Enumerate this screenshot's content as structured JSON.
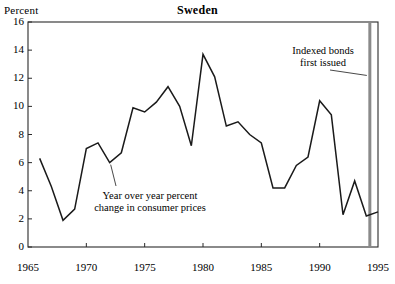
{
  "chart_data": {
    "type": "line",
    "title": "Sweden",
    "ylabel": "Percent",
    "xlabel": "",
    "ylim": [
      0,
      16
    ],
    "xlim": [
      1965,
      1995
    ],
    "yticks": [
      0,
      2,
      4,
      6,
      8,
      10,
      12,
      14,
      16
    ],
    "xticks": [
      1965,
      1970,
      1975,
      1980,
      1985,
      1990,
      1995
    ],
    "grid": false,
    "legend": "none",
    "series_name": "Year over year percent change in consumer prices",
    "x": [
      1966,
      1967,
      1968,
      1969,
      1970,
      1971,
      1972,
      1973,
      1974,
      1975,
      1976,
      1977,
      1978,
      1979,
      1980,
      1981,
      1982,
      1983,
      1984,
      1985,
      1986,
      1987,
      1988,
      1989,
      1990,
      1991,
      1992,
      1993,
      1994,
      1995
    ],
    "values": [
      6.3,
      4.3,
      1.9,
      2.7,
      7.0,
      7.4,
      6.0,
      6.7,
      9.9,
      9.6,
      10.3,
      11.4,
      10.0,
      7.2,
      13.7,
      12.1,
      8.6,
      8.9,
      8.0,
      7.4,
      4.2,
      4.2,
      5.8,
      6.4,
      10.4,
      9.4,
      2.3,
      4.7,
      2.2,
      2.5
    ],
    "annotations": [
      {
        "name": "series-label",
        "text_lines": [
          "Year over year percent",
          "change in consumer prices"
        ],
        "points_to_x": 1972,
        "points_to_y": 6.0
      },
      {
        "name": "indexed-bonds-label",
        "text_lines": [
          "Indexed bonds",
          "first issued"
        ],
        "points_to_x": 1994.3,
        "points_to_y": 12.2
      }
    ],
    "vertical_marker": {
      "name": "indexed-bonds-marker",
      "x": 1994.3,
      "color": "#8a8a8a"
    },
    "line_color": "#1a1a1a",
    "frame_color": "#2a2a2a"
  },
  "labels": {
    "unit": "Percent",
    "title": "Sweden",
    "yticks": [
      "0",
      "2",
      "4",
      "6",
      "8",
      "10",
      "12",
      "14",
      "16"
    ],
    "xticks": [
      "1965",
      "1970",
      "1975",
      "1980",
      "1985",
      "1990",
      "1995"
    ],
    "anno_series_line1": "Year over year percent",
    "anno_series_line2": "change in consumer prices",
    "anno_bonds_line1": "Indexed bonds",
    "anno_bonds_line2": "first issued"
  }
}
